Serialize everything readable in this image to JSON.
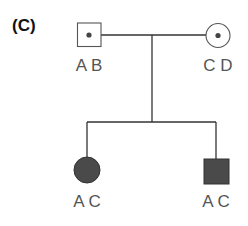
{
  "panel_label": "(C)",
  "colors": {
    "line": "#333333",
    "affected_fill": "#4a4a4a",
    "label": "#555555"
  },
  "pedigree": {
    "parents": [
      {
        "id": "father",
        "sex": "male",
        "status": "carrier",
        "genotype": "A B"
      },
      {
        "id": "mother",
        "sex": "female",
        "status": "carrier",
        "genotype": "C D"
      }
    ],
    "children": [
      {
        "id": "daughter",
        "sex": "female",
        "status": "affected",
        "genotype": "A C"
      },
      {
        "id": "son",
        "sex": "male",
        "status": "affected",
        "genotype": "A C"
      }
    ]
  }
}
